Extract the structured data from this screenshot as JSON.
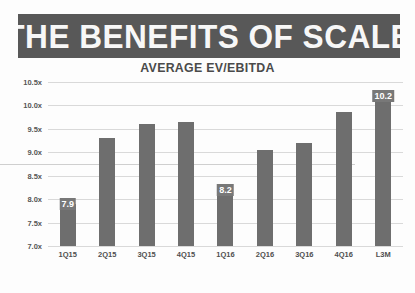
{
  "header": {
    "title": "THE BENEFITS OF SCALE",
    "subtitle": "AVERAGE EV/EBITDA"
  },
  "colors": {
    "banner": "#585858",
    "bar": "#6e6e6e",
    "label_badge": "#787878",
    "gridline": "#d9d9d9",
    "title_text": "#f7f7f7"
  },
  "chart_data": {
    "type": "bar",
    "title": "THE BENEFITS OF SCALE",
    "subtitle": "AVERAGE EV/EBITDA",
    "xlabel": "",
    "ylabel": "",
    "ylim": [
      7.0,
      10.5
    ],
    "ytick_labels": [
      "10.5x",
      "10.0x",
      "9.5x",
      "9.0x",
      "8.5x",
      "8.0x",
      "7.5x",
      "7.0x"
    ],
    "ytick_values": [
      10.5,
      10.0,
      9.5,
      9.0,
      8.5,
      8.0,
      7.5,
      7.0
    ],
    "grid": true,
    "legend": "none",
    "categories": [
      "1Q15",
      "2Q15",
      "3Q15",
      "4Q15",
      "1Q16",
      "2Q16",
      "3Q16",
      "4Q16",
      "L3M"
    ],
    "values": [
      7.9,
      9.3,
      9.6,
      9.65,
      8.2,
      9.05,
      9.2,
      9.85,
      10.2
    ],
    "point_labels": [
      "7.9",
      "",
      "",
      "",
      "8.2",
      "",
      "",
      "",
      "10.2"
    ],
    "labeled_points": [
      {
        "category": "1Q15",
        "value": 7.9,
        "label": "7.9"
      },
      {
        "category": "1Q16",
        "value": 8.2,
        "label": "8.2"
      },
      {
        "category": "L3M",
        "value": 10.2,
        "label": "10.2"
      }
    ]
  }
}
